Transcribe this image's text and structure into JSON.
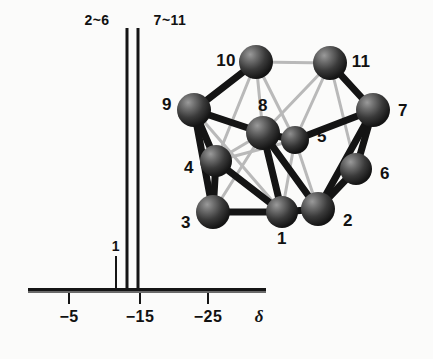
{
  "figure": {
    "background_color": "#fbfbfa",
    "ink_color": "#151515"
  },
  "spectrum": {
    "axis_symbol": "δ",
    "baseline": {
      "x_start": 28,
      "x_end": 266,
      "y": 291
    },
    "ticks": [
      {
        "label": "−5",
        "x": 69,
        "value": -5
      },
      {
        "label": "−15",
        "x": 140,
        "value": -15
      },
      {
        "label": "−25",
        "x": 208,
        "value": -25
      }
    ],
    "peak_labels": [
      {
        "text": "2~6",
        "x": 97,
        "y": 14
      },
      {
        "text": "7~11",
        "x": 170,
        "y": 14
      },
      {
        "text": "1",
        "x": 116,
        "y": 241
      }
    ],
    "peaks": [
      {
        "name": "peak-1",
        "assignment": "1",
        "x": 116,
        "top_y": 256,
        "height": 35,
        "width": 2,
        "shift": -11.6
      },
      {
        "name": "peak-2to6",
        "assignment": "2~6",
        "x": 127,
        "top_y": 28,
        "height": 263,
        "width": 3,
        "shift": -13.2
      },
      {
        "name": "peak-7to11",
        "assignment": "7~11",
        "x": 138,
        "top_y": 28,
        "height": 263,
        "width": 3,
        "shift": -14.8
      }
    ]
  },
  "cluster": {
    "caption": "11-vertex cluster skeleton",
    "atom_color": "#2b2b2b",
    "atoms": [
      {
        "id": "1",
        "label": "1",
        "cx": 282,
        "cy": 212,
        "r": 15,
        "label_x": 282,
        "label_y": 239
      },
      {
        "id": "2",
        "label": "2",
        "cx": 318,
        "cy": 209,
        "r": 16,
        "label_x": 348,
        "label_y": 221
      },
      {
        "id": "3",
        "label": "3",
        "cx": 213,
        "cy": 212,
        "r": 16,
        "label_x": 186,
        "label_y": 223
      },
      {
        "id": "4",
        "label": "4",
        "cx": 216,
        "cy": 161,
        "r": 15,
        "label_x": 189,
        "label_y": 168
      },
      {
        "id": "5",
        "label": "5",
        "cx": 295,
        "cy": 140,
        "r": 14,
        "label_x": 322,
        "label_y": 137
      },
      {
        "id": "6",
        "label": "6",
        "cx": 356,
        "cy": 169,
        "r": 15,
        "label_x": 385,
        "label_y": 174
      },
      {
        "id": "7",
        "label": "7",
        "cx": 373,
        "cy": 110,
        "r": 16,
        "label_x": 403,
        "label_y": 111
      },
      {
        "id": "8",
        "label": "8",
        "cx": 263,
        "cy": 133,
        "r": 16,
        "label_x": 263,
        "label_y": 108
      },
      {
        "id": "9",
        "label": "9",
        "cx": 194,
        "cy": 110,
        "r": 16,
        "label_x": 167,
        "label_y": 105
      },
      {
        "id": "10",
        "label": "10",
        "cx": 256,
        "cy": 62,
        "r": 16,
        "label_x": 226,
        "label_y": 61
      },
      {
        "id": "11",
        "label": "11",
        "cx": 330,
        "cy": 63,
        "r": 16,
        "label_x": 361,
        "label_y": 62
      }
    ],
    "bonds_front": [
      [
        "9",
        "10"
      ],
      [
        "10",
        "11"
      ],
      [
        "11",
        "7"
      ],
      [
        "9",
        "4"
      ],
      [
        "9",
        "3"
      ],
      [
        "9",
        "8"
      ],
      [
        "4",
        "3"
      ],
      [
        "3",
        "1"
      ],
      [
        "1",
        "2"
      ],
      [
        "2",
        "6"
      ],
      [
        "6",
        "7"
      ],
      [
        "8",
        "1"
      ],
      [
        "8",
        "2"
      ],
      [
        "8",
        "5"
      ],
      [
        "5",
        "7"
      ],
      [
        "7",
        "2"
      ],
      [
        "4",
        "1"
      ],
      [
        "7",
        "6"
      ],
      [
        "2",
        "7"
      ]
    ],
    "bonds_back": [
      [
        "10",
        "8"
      ],
      [
        "10",
        "4"
      ],
      [
        "10",
        "5"
      ],
      [
        "11",
        "8"
      ],
      [
        "11",
        "5"
      ],
      [
        "11",
        "6"
      ],
      [
        "9",
        "1"
      ],
      [
        "4",
        "8"
      ],
      [
        "5",
        "2"
      ],
      [
        "5",
        "1"
      ],
      [
        "3",
        "8"
      ],
      [
        "4",
        "5"
      ]
    ]
  }
}
